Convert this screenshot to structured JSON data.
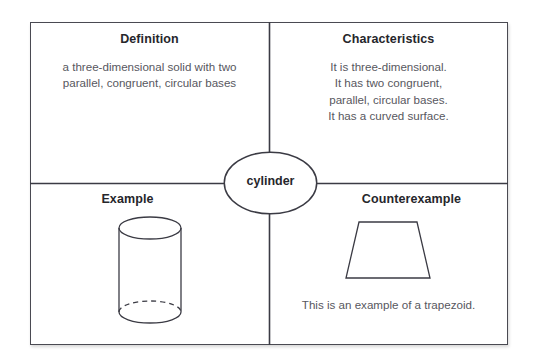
{
  "diagram": {
    "type": "frayer-model",
    "term": "cylinder",
    "ink_color": "#3b3b44",
    "heading_color": "#26262b",
    "body_color": "#575760",
    "quadrants": [
      {
        "key": "definition",
        "heading": "Definition",
        "body": "a three-dimensional solid with two parallel, congruent, circular bases"
      },
      {
        "key": "characteristics",
        "heading": "Characteristics",
        "body": "It is three-dimensional.\nIt has two congruent,\nparallel, circular bases.\nIt has a curved surface."
      },
      {
        "key": "example",
        "heading": "Example",
        "figure": "cylinder-shape"
      },
      {
        "key": "counterexample",
        "heading": "Counterexample",
        "figure": "trapezoid-shape",
        "caption": "This is an example of a trapezoid."
      }
    ]
  }
}
